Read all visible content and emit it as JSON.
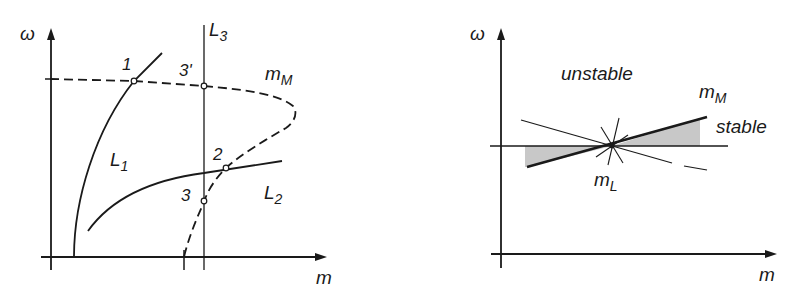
{
  "left_panel": {
    "y_axis_label": "ω",
    "x_axis_label": "m",
    "curves": {
      "L1": {
        "base": "L",
        "sub": "1"
      },
      "L2": {
        "base": "L",
        "sub": "2"
      },
      "L3": {
        "base": "L",
        "sub": "3"
      },
      "mM": {
        "base": "m",
        "sub": "M"
      }
    },
    "points": [
      "1",
      "2",
      "3",
      "3'"
    ]
  },
  "right_panel": {
    "y_axis_label": "ω",
    "x_axis_label": "m",
    "region_unstable": "unstable",
    "region_stable": "stable",
    "mM": {
      "base": "m",
      "sub": "M"
    },
    "mL": {
      "base": "m",
      "sub": "L"
    }
  },
  "colors": {
    "ink": "#1a1a1a",
    "shade": "#c8c8c8"
  }
}
